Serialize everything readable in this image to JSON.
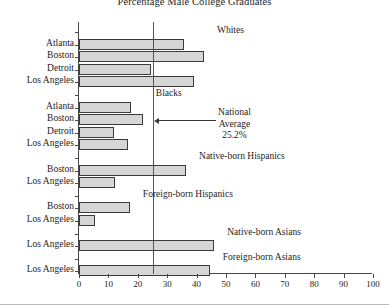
{
  "chart_data": {
    "type": "bar",
    "orientation": "horizontal",
    "title": "Percentage Male College Graduates",
    "xlabel": "",
    "ylabel": "",
    "xlim": [
      0,
      100
    ],
    "xticks": [
      0,
      10,
      20,
      30,
      40,
      50,
      60,
      70,
      80,
      90,
      100
    ],
    "grid": false,
    "legend": "none",
    "reference_line": {
      "value": 25.2,
      "label_line1": "National",
      "label_line2": "Average",
      "label_line3": "25.2%"
    },
    "groups": [
      {
        "name": "Whites",
        "categories": [
          "Atlanta",
          "Boston",
          "Detroit",
          "Los Angeles"
        ],
        "values": [
          35.6,
          42.5,
          24.5,
          39.1
        ]
      },
      {
        "name": "Blacks",
        "categories": [
          "Atlanta",
          "Boston",
          "Detroit",
          "Los Angeles"
        ],
        "values": [
          17.7,
          21.7,
          11.8,
          16.8
        ]
      },
      {
        "name": "Native-born Hispanics",
        "categories": [
          "Boston",
          "Los Angeles"
        ],
        "values": [
          36.4,
          12.2
        ]
      },
      {
        "name": "Foreign-born Hispanics",
        "categories": [
          "Boston",
          "Los Angeles"
        ],
        "values": [
          17.3,
          5.5
        ]
      },
      {
        "name": "Native-born Asians",
        "categories": [
          "Los Angeles"
        ],
        "values": [
          46.0
        ]
      },
      {
        "name": "Foreign-born Asians",
        "categories": [
          "Los Angeles"
        ],
        "values": [
          44.5
        ]
      }
    ],
    "colors": {
      "bar_fill": "#d6d6d6",
      "bar_edge": "#3a3a3a",
      "axis": "#4a4a4a",
      "reference_line": "#555555",
      "text": "#1d1d1d",
      "background": "#ffffff"
    }
  }
}
